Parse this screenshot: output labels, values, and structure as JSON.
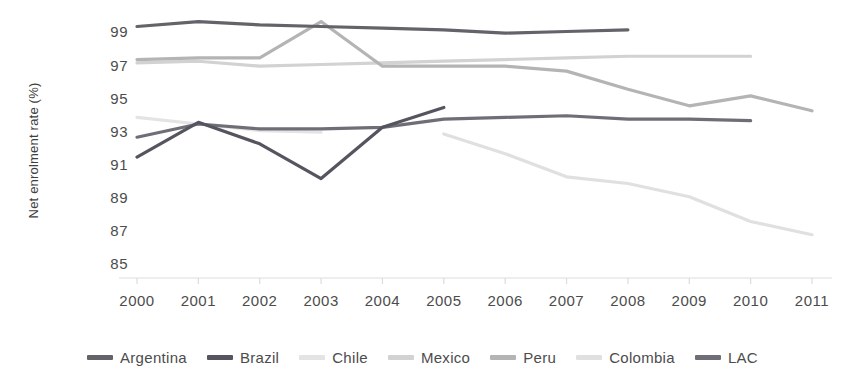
{
  "chart_data": {
    "type": "line",
    "title": "",
    "xlabel": "",
    "ylabel": "Net enrolment rate (%)",
    "x": [
      2000,
      2001,
      2002,
      2003,
      2004,
      2005,
      2006,
      2007,
      2008,
      2009,
      2010,
      2011
    ],
    "xtick_labels": [
      "2000",
      "2001",
      "2002",
      "2003",
      "2004",
      "2005",
      "2006",
      "2007",
      "2008",
      "2009",
      "2010",
      "2011"
    ],
    "ytick_labels": [
      "99",
      "97",
      "95",
      "93",
      "91",
      "89",
      "87",
      "85"
    ],
    "yticks": [
      99,
      97,
      95,
      93,
      91,
      89,
      87,
      85
    ],
    "ylim": [
      84.2,
      100.3
    ],
    "xlim": [
      2000,
      2011
    ],
    "grid": false,
    "legend_position": "bottom",
    "series": [
      {
        "name": "Argentina",
        "color": "#63636a",
        "x": [
          2000,
          2001,
          2002,
          2003,
          2004,
          2005,
          2006,
          2007,
          2008
        ],
        "values": [
          99.3,
          99.6,
          99.4,
          99.3,
          99.2,
          99.1,
          98.9,
          99.0,
          99.1
        ]
      },
      {
        "name": "Brazil",
        "color": "#555560",
        "x": [
          2000,
          2001,
          2002,
          2003,
          2004,
          2005
        ],
        "values": [
          91.4,
          93.5,
          92.2,
          90.1,
          93.2,
          94.4
        ]
      },
      {
        "name": "Chile",
        "color": "#e4e4e4",
        "x": [
          2000,
          2001,
          2002,
          2003
        ],
        "values": [
          93.8,
          93.4,
          93.0,
          92.9
        ]
      },
      {
        "name": "Mexico",
        "color": "#d2d2d2",
        "x": [
          2000,
          2001,
          2002,
          2003,
          2004,
          2005,
          2006,
          2007,
          2008,
          2009,
          2010
        ],
        "values": [
          97.1,
          97.2,
          96.9,
          97.0,
          97.1,
          97.2,
          97.3,
          97.4,
          97.5,
          97.5,
          97.5
        ]
      },
      {
        "name": "Peru",
        "color": "#b4b4b4",
        "x": [
          2000,
          2001,
          2002,
          2003,
          2004,
          2005,
          2006,
          2007,
          2008,
          2009,
          2010,
          2011
        ],
        "values": [
          97.3,
          97.4,
          97.4,
          99.6,
          96.9,
          96.9,
          96.9,
          96.6,
          95.5,
          94.5,
          95.1,
          94.2
        ]
      },
      {
        "name": "Colombia",
        "color": "#e0e0e0",
        "x": [
          2005,
          2006,
          2007,
          2008,
          2009,
          2010,
          2011
        ],
        "values": [
          92.8,
          91.6,
          90.2,
          89.8,
          89.0,
          87.5,
          86.7
        ]
      },
      {
        "name": "LAC",
        "color": "#6e6e76",
        "x": [
          2000,
          2001,
          2002,
          2003,
          2004,
          2005,
          2006,
          2007,
          2008,
          2009,
          2010
        ],
        "values": [
          92.6,
          93.4,
          93.1,
          93.1,
          93.2,
          93.7,
          93.8,
          93.9,
          93.7,
          93.7,
          93.6
        ]
      }
    ]
  },
  "axis": {
    "line_color": "#e8e8e8",
    "tick_color": "#dcdcdc"
  }
}
